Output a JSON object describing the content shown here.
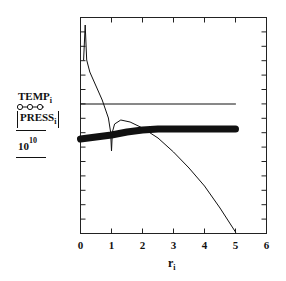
{
  "chart_data": {
    "type": "line",
    "title": "",
    "xlabel": "r_i",
    "ylabel": "TEMP_i, |PRESS_i| / 10^10",
    "xlim": [
      0,
      6
    ],
    "x_ticks": [
      "0",
      "1",
      "2",
      "3",
      "4",
      "5",
      "6"
    ],
    "y_ticks": [],
    "grid": false,
    "legend": "stacked y-axis label (no separate legend)",
    "series": [
      {
        "name": "TEMP_i (constant line)",
        "style": "thin line",
        "x": [
          0,
          5
        ],
        "y_px": [
          104,
          104
        ]
      },
      {
        "name": "TEMP_i (thick curve)",
        "style": "thick line",
        "x": [
          0,
          0.5,
          1.0,
          1.5,
          2.0,
          2.5,
          3.0,
          4.0,
          5.0
        ],
        "y_px": [
          139,
          137,
          135,
          132,
          130,
          129,
          129,
          129,
          129
        ]
      },
      {
        "name": "|PRESS_i| / 10^10",
        "style": "thin line with o-o-o markers in label",
        "x": [
          0.1,
          0.15,
          0.2,
          0.3,
          0.5,
          0.7,
          0.9,
          0.97,
          1.0,
          1.03,
          1.1,
          1.3,
          1.6,
          2.0,
          2.5,
          3.0,
          3.5,
          4.0,
          4.5,
          5.0
        ],
        "y_px": [
          60,
          25,
          60,
          72,
          86,
          100,
          118,
          132,
          151,
          132,
          124,
          120,
          122,
          128,
          138,
          152,
          168,
          186,
          208,
          232
        ]
      }
    ]
  },
  "axes": {
    "x_ticks": [
      "0",
      "1",
      "2",
      "3",
      "4",
      "5",
      "6"
    ],
    "x_label_main": "r",
    "x_label_sub": "i"
  },
  "ylabel": {
    "temp_main": "TEMP",
    "temp_sub": "i",
    "press_main": "PRESS",
    "press_sub": "i",
    "divisor_base": "10",
    "divisor_exp": "10"
  }
}
